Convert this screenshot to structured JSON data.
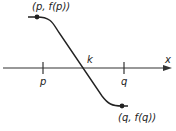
{
  "diagram": {
    "axis_label": "x",
    "ticks": [
      {
        "label": "p"
      },
      {
        "label": "q"
      }
    ],
    "root_label": "k",
    "points": [
      {
        "label": "(p, f(p))"
      },
      {
        "label": "(q, f(q))"
      }
    ],
    "colors": {
      "line": "#222222",
      "background": "#ffffff"
    }
  }
}
